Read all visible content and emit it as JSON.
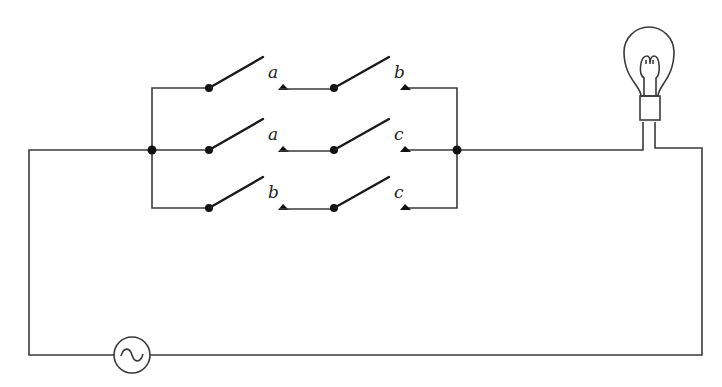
{
  "diagram": {
    "colors": {
      "line": "#3a3a3a",
      "background": "#ffffff"
    },
    "components": {
      "lamp": {
        "name": "light-bulb",
        "x": 649,
        "y": 50
      },
      "source": {
        "name": "ac-source",
        "symbol": "~",
        "x": 132,
        "y": 355
      }
    },
    "branches": [
      {
        "row": "top",
        "y": 88,
        "switches": [
          {
            "label": "a"
          },
          {
            "label": "b"
          }
        ]
      },
      {
        "row": "middle",
        "y": 150,
        "switches": [
          {
            "label": "a"
          },
          {
            "label": "c"
          }
        ]
      },
      {
        "row": "bottom",
        "y": 208,
        "switches": [
          {
            "label": "b"
          },
          {
            "label": "c"
          }
        ]
      }
    ]
  }
}
